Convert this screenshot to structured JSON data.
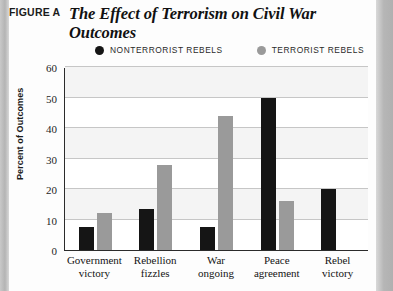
{
  "header": {
    "figure_label": "FIGURE A",
    "title": "The Effect of Terrorism on Civil War Outcomes"
  },
  "legend": {
    "position": "top",
    "items": [
      {
        "label": "NONTERRORIST REBELS",
        "color": "#151515",
        "marker": "filled-circle-icon"
      },
      {
        "label": "TERRORIST REBELS",
        "color": "#9a9a9a",
        "marker": "filled-circle-icon"
      }
    ]
  },
  "chart_data": {
    "type": "bar",
    "title": "The Effect of Terrorism on Civil War Outcomes",
    "xlabel": "",
    "ylabel": "Percent of Outcomes",
    "ylim": [
      0,
      60
    ],
    "yticks": [
      60,
      50,
      40,
      30,
      20,
      10,
      0
    ],
    "grid": true,
    "categories": [
      "Government victory",
      "Rebellion fizzles",
      "War ongoing",
      "Peace agreement",
      "Rebel victory"
    ],
    "category_lines": [
      [
        "Government",
        "victory"
      ],
      [
        "Rebellion",
        "fizzles"
      ],
      [
        "War",
        "ongoing"
      ],
      [
        "Peace",
        "agreement"
      ],
      [
        "Rebel",
        "victory"
      ]
    ],
    "series": [
      {
        "name": "NONTERRORIST REBELS",
        "color": "#151515",
        "values": [
          7.5,
          13.5,
          7.5,
          50,
          20
        ]
      },
      {
        "name": "TERRORIST REBELS",
        "color": "#9a9a9a",
        "values": [
          12,
          28,
          44,
          16,
          0
        ]
      }
    ]
  }
}
